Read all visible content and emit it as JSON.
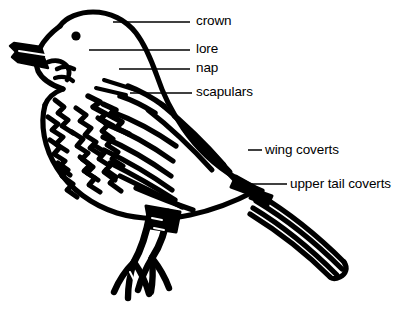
{
  "diagram": {
    "style": "black-and-white line art",
    "background_color": "#ffffff",
    "ink_color": "#000000",
    "leader_line_color": "#000000",
    "labels": [
      {
        "id": "crown",
        "text": "crown",
        "text_x": 196,
        "text_y": 14,
        "leader": {
          "x1": 113,
          "y1": 22,
          "x2": 190,
          "y2": 22
        }
      },
      {
        "id": "lore",
        "text": "lore",
        "text_x": 196,
        "text_y": 42,
        "leader": {
          "x1": 89,
          "y1": 50,
          "x2": 190,
          "y2": 50
        }
      },
      {
        "id": "nap",
        "text": "nap",
        "text_x": 196,
        "text_y": 61,
        "leader": {
          "x1": 119,
          "y1": 69,
          "x2": 190,
          "y2": 69
        }
      },
      {
        "id": "scapulars",
        "text": "scapulars",
        "text_x": 196,
        "text_y": 85,
        "leader": {
          "x1": 130,
          "y1": 93,
          "x2": 192,
          "y2": 93
        }
      },
      {
        "id": "wing-coverts",
        "text": "wing coverts",
        "text_x": 265,
        "text_y": 143,
        "leader": {
          "x1": 248,
          "y1": 150,
          "x2": 262,
          "y2": 150
        }
      },
      {
        "id": "upper-tail-coverts",
        "text": "upper tail coverts",
        "text_x": 290,
        "text_y": 177,
        "leader": {
          "x1": 238,
          "y1": 184,
          "x2": 287,
          "y2": 184
        }
      }
    ],
    "parts": [
      {
        "id": "head",
        "name": "head"
      },
      {
        "id": "beak",
        "name": "beak"
      },
      {
        "id": "eye",
        "name": "eye"
      },
      {
        "id": "breast",
        "name": "breast"
      },
      {
        "id": "wing",
        "name": "wing"
      },
      {
        "id": "tail",
        "name": "tail"
      },
      {
        "id": "legs",
        "name": "legs-and-feet"
      }
    ]
  }
}
